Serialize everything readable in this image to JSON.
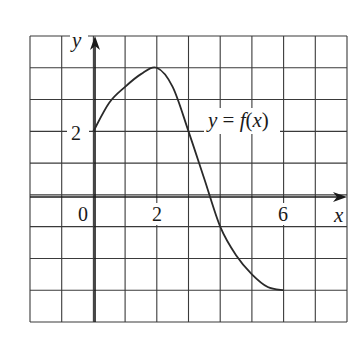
{
  "chart_data": {
    "type": "line",
    "title": "",
    "xlabel": "x",
    "ylabel": "y",
    "xlim": [
      -2,
      8
    ],
    "ylim": [
      -4,
      5
    ],
    "grid": true,
    "grid_step": 1,
    "x_tick_labels": [
      {
        "value": 0,
        "label": "0"
      },
      {
        "value": 2,
        "label": "2"
      },
      {
        "value": 6,
        "label": "6"
      }
    ],
    "y_tick_labels": [
      {
        "value": 2,
        "label": "2"
      }
    ],
    "series": [
      {
        "name": "y = f(x)",
        "x": [
          0,
          0.5,
          1,
          1.5,
          2,
          2.5,
          3,
          3.5,
          4,
          4.5,
          5,
          5.5,
          6
        ],
        "y": [
          2,
          2.9,
          3.4,
          3.8,
          4,
          3.4,
          2,
          0.5,
          -1,
          -1.9,
          -2.5,
          -2.9,
          -3
        ]
      }
    ],
    "annotations": [
      {
        "text": "y = f(x)",
        "x": 3.6,
        "y": 2.2
      }
    ]
  },
  "labels": {
    "y_axis": "y",
    "x_axis": "x",
    "function": "y = f(x)",
    "origin": "0",
    "x2": "2",
    "x6": "6",
    "y2": "2"
  }
}
